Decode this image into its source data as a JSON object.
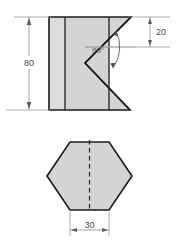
{
  "drawing": {
    "title": "Orthographic Projection - Notched Prism",
    "background_color": "#ffffff",
    "views": [
      {
        "name": "front-view",
        "label": "Front View",
        "face_fill": "#d4d4d4",
        "face_fill_light": "#dcdcdc",
        "outline_color": "#1a1a1a",
        "interior_line_color": "#2b2b2b"
      },
      {
        "name": "top-view",
        "label": "Top View",
        "face_fill": "#d4d4d4",
        "outline_color": "#1a1a1a",
        "center_line_color": "#2b2b2b",
        "center_line_style": "dashed"
      }
    ],
    "dimensions": [
      {
        "id": "height",
        "value": "80",
        "orientation": "vertical",
        "placement": "left-of-front-view",
        "arrow_style": "double",
        "color": "#808080"
      },
      {
        "id": "notch-depth",
        "value": "20",
        "orientation": "vertical",
        "placement": "right-of-front-view",
        "arrow_style": "double",
        "color": "#808080"
      },
      {
        "id": "width",
        "value": "30",
        "orientation": "horizontal",
        "placement": "below-top-view",
        "arrow_style": "double",
        "color": "#808080"
      }
    ],
    "annotations": [
      {
        "id": "notch-angle",
        "value": "90°",
        "type": "angular",
        "arc_arrow_style": "double",
        "color": "#4a4a4a"
      }
    ],
    "colors": {
      "line": "#1a1a1a",
      "fill": "#d4d4d4",
      "fill_light": "#dcdcdc",
      "dimension": "#7d7d7d",
      "text": "#4a4a4a"
    }
  }
}
